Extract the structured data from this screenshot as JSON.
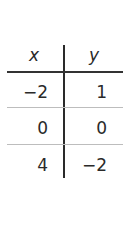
{
  "table": {
    "headers": [
      "x",
      "y"
    ],
    "rows": [
      {
        "x": "−2",
        "y": "1"
      },
      {
        "x": "0",
        "y": "0"
      },
      {
        "x": "4",
        "y": "−2"
      }
    ]
  }
}
